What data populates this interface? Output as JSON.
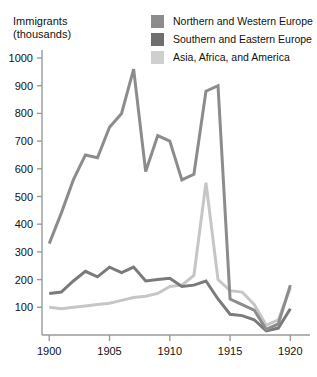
{
  "chart_data": {
    "type": "line",
    "title": "",
    "ylabel": "Immigrants\n(thousands)",
    "ylabel_line1": "Immigrants",
    "ylabel_line2": "(thousands)",
    "xlabel": "",
    "x": [
      1900,
      1901,
      1902,
      1903,
      1904,
      1905,
      1906,
      1907,
      1908,
      1909,
      1910,
      1911,
      1912,
      1913,
      1914,
      1915,
      1916,
      1917,
      1918,
      1919,
      1920
    ],
    "xlim": [
      1899.4,
      1920.8
    ],
    "ylim": [
      0,
      1030
    ],
    "yticks": [
      100,
      200,
      300,
      400,
      500,
      600,
      700,
      800,
      900,
      1000
    ],
    "ytick_labels": [
      "100",
      "200",
      "300",
      "400",
      "500",
      "600",
      "700",
      "800",
      "900",
      "1000"
    ],
    "xticks": [
      1900,
      1905,
      1910,
      1915,
      1920
    ],
    "xtick_labels": [
      "1900",
      "1905",
      "1910",
      "1915",
      "1920"
    ],
    "grid": false,
    "legend_position": "top-right",
    "series": [
      {
        "name": "Northern and Western Europe",
        "color": "#8c8c8c",
        "values": [
          330,
          440,
          560,
          650,
          640,
          750,
          800,
          960,
          590,
          720,
          700,
          560,
          580,
          880,
          900,
          130,
          110,
          90,
          20,
          40,
          180
        ]
      },
      {
        "name": "Southern and Eastern Europe",
        "color": "#7a7a7a",
        "values": [
          150,
          155,
          195,
          230,
          210,
          245,
          225,
          245,
          195,
          200,
          205,
          175,
          180,
          195,
          130,
          75,
          70,
          55,
          15,
          25,
          95
        ]
      },
      {
        "name": "Asia, Africa, and America",
        "color": "#c6c6c6",
        "values": [
          100,
          95,
          100,
          105,
          110,
          115,
          125,
          135,
          140,
          150,
          175,
          180,
          215,
          550,
          200,
          160,
          155,
          110,
          35,
          55,
          170
        ]
      }
    ]
  },
  "legend": {
    "items": [
      {
        "label": "Northern and Western Europe",
        "color": "#8c8c8c"
      },
      {
        "label": "Southern and Eastern Europe",
        "color": "#6f6f6f"
      },
      {
        "label": "Asia, Africa, and America",
        "color": "#cfcfcf"
      }
    ]
  },
  "axes": {
    "axis_color": "#9a9a9a",
    "tick_color": "#9a9a9a"
  }
}
